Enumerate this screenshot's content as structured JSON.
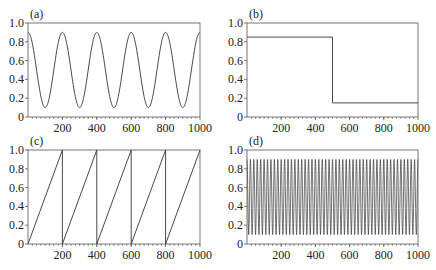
{
  "figure": {
    "panels": [
      "(a)",
      "(b)",
      "(c)",
      "(d)"
    ]
  },
  "style": {
    "line_color": "#333333",
    "axis_color": "#555555",
    "text_color": "#222222",
    "background": "#ffffff"
  },
  "chart_data": [
    {
      "panel_label": "(a)",
      "type": "line",
      "title": "",
      "xlabel": "",
      "ylabel": "",
      "xlim": [
        0,
        1000
      ],
      "ylim": [
        0,
        1.0
      ],
      "xticks": [
        200,
        400,
        600,
        800,
        1000
      ],
      "xtick_labels": [
        "200",
        "400",
        "600",
        "800",
        "1000"
      ],
      "yticks": [
        0,
        0.2,
        0.4,
        0.6,
        0.8,
        1.0
      ],
      "ytick_labels": [
        "0",
        "0.2",
        "0.4",
        "0.6",
        "0.8",
        "1.0"
      ],
      "grid": false,
      "series": [
        {
          "name": "cosine",
          "function": "0.5 + 0.4*cos(2*pi*x/200)",
          "period": 200,
          "min": 0.1,
          "max": 0.9,
          "x": [
            0,
            100,
            200,
            300,
            400,
            500,
            600,
            700,
            800,
            900,
            1000
          ],
          "y": [
            0.9,
            0.1,
            0.9,
            0.1,
            0.9,
            0.1,
            0.9,
            0.1,
            0.9,
            0.1,
            0.9
          ]
        }
      ]
    },
    {
      "panel_label": "(b)",
      "type": "line",
      "title": "",
      "xlabel": "",
      "ylabel": "",
      "xlim": [
        0,
        1000
      ],
      "ylim": [
        0,
        1.0
      ],
      "xticks": [
        200,
        400,
        600,
        800,
        1000
      ],
      "xtick_labels": [
        "200",
        "400",
        "600",
        "800",
        "1000"
      ],
      "yticks": [
        0,
        0.2,
        0.4,
        0.6,
        0.8,
        1.0
      ],
      "ytick_labels": [
        "0",
        "0.2",
        "0.4",
        "0.6",
        "0.8",
        "1.0"
      ],
      "grid": false,
      "series": [
        {
          "name": "step",
          "x": [
            0,
            500,
            500,
            1000
          ],
          "y": [
            0.85,
            0.85,
            0.15,
            0.15
          ]
        }
      ]
    },
    {
      "panel_label": "(c)",
      "type": "line",
      "title": "",
      "xlabel": "",
      "ylabel": "",
      "xlim": [
        0,
        1000
      ],
      "ylim": [
        0,
        1.0
      ],
      "xticks": [
        200,
        400,
        600,
        800,
        1000
      ],
      "xtick_labels": [
        "200",
        "400",
        "600",
        "800",
        "1000"
      ],
      "yticks": [
        0,
        0.2,
        0.4,
        0.6,
        0.8,
        1.0
      ],
      "ytick_labels": [
        "0",
        "0.2",
        "0.4",
        "0.6",
        "0.8",
        "1.0"
      ],
      "grid": false,
      "series": [
        {
          "name": "sawtooth",
          "period": 200,
          "x": [
            0,
            200,
            200,
            400,
            400,
            600,
            600,
            800,
            800,
            1000
          ],
          "y": [
            0,
            1.0,
            0,
            1.0,
            0,
            1.0,
            0,
            1.0,
            0,
            1.0
          ]
        }
      ]
    },
    {
      "panel_label": "(d)",
      "type": "line",
      "title": "",
      "xlabel": "",
      "ylabel": "",
      "xlim": [
        0,
        1000
      ],
      "ylim": [
        0,
        1.0
      ],
      "xticks": [
        200,
        400,
        600,
        800,
        1000
      ],
      "xtick_labels": [
        "200",
        "400",
        "600",
        "800",
        "1000"
      ],
      "yticks": [
        0,
        0.2,
        0.4,
        0.6,
        0.8,
        1.0
      ],
      "ytick_labels": [
        "0",
        "0.2",
        "0.4",
        "0.6",
        "0.8",
        "1.0"
      ],
      "grid": false,
      "series": [
        {
          "name": "fast oscillation",
          "function": "0.5 + 0.4*cos(2*pi*x/20)",
          "period": 20,
          "min": 0.1,
          "max": 0.9
        }
      ]
    }
  ]
}
